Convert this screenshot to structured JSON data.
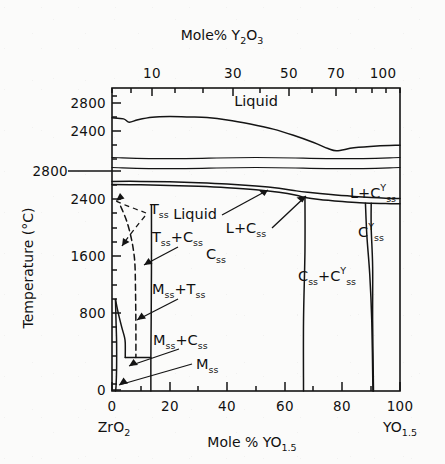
{
  "figure": {
    "kind": "phase-diagram",
    "top_axis_title": "Mole% Y2O3",
    "top_axis_title_parts": {
      "prefix": "Mole% Y",
      "sub1": "2",
      "mid": "O",
      "sub2": "3"
    },
    "bottom_axis_title_parts": {
      "prefix": "Mole % YO",
      "sub": "1.5"
    },
    "y_axis_title": "Temperature (°C)",
    "left_endmember": {
      "prefix": "ZrO",
      "sub": "2"
    },
    "right_endmember": {
      "prefix": "YO",
      "sub": "1.5"
    },
    "line_color": "#141414"
  },
  "axes": {
    "top_ticks_labeled": [
      "10",
      "30",
      "50",
      "70",
      "100"
    ],
    "top_ticks_labeled_x": [
      152,
      233,
      289,
      336,
      383
    ],
    "top_ticks_minor_x": [
      112,
      131,
      152,
      175,
      203,
      233,
      260,
      289,
      312,
      336,
      356,
      372,
      386,
      400
    ],
    "bottom_ticks_labeled": [
      "0",
      "20",
      "40",
      "60",
      "80",
      "100"
    ],
    "bottom_ticks_labeled_x": [
      112,
      170,
      227,
      285,
      342,
      400
    ],
    "bottom_ticks_minor_x": [
      112,
      141,
      170,
      198,
      227,
      256,
      285,
      313,
      342,
      371,
      400
    ],
    "left_ticks_labeled_upper": [
      "2800",
      "2400"
    ],
    "left_ticks_labeled_upper_y": [
      103,
      131
    ],
    "left_ticks_labeled_lower": [
      "2800",
      "2400",
      "1600",
      "800",
      "0"
    ],
    "left_ticks_labeled_lower_y": [
      171,
      199,
      256,
      313,
      390
    ],
    "left_ticks_minor_y": [
      96,
      103,
      117,
      131,
      145,
      159,
      171,
      185,
      199,
      213,
      228,
      242,
      256,
      270,
      285,
      299,
      313,
      327,
      342,
      356,
      370,
      384,
      390
    ],
    "break_marker_y": 171,
    "x_range": [
      0,
      100
    ],
    "plot_box": {
      "left": 112,
      "right": 400,
      "top": 88,
      "bottom": 391
    }
  },
  "labels": {
    "liquid_upper": "Liquid",
    "liquid_lower": "Liquid",
    "l_plus_css": {
      "prefix": "L+C",
      "sub": "ss"
    },
    "l_plus_css_y": {
      "prefix": "L+C",
      "sub": "ss",
      "sup": "Y"
    },
    "css_y": {
      "prefix": "C",
      "sub": "ss",
      "sup": "Y"
    },
    "css": {
      "prefix": "C",
      "sub": "ss"
    },
    "css_plus_css_y": {
      "prefix": "C",
      "sub": "ss",
      "plus": "+C",
      "sub2": "ss",
      "sup": "Y"
    },
    "tss": {
      "prefix": "T",
      "sub": "ss"
    },
    "tss_plus_css": {
      "prefix": "T",
      "sub": "ss",
      "plus": "+C",
      "sub2": "ss"
    },
    "mss_plus_tss": {
      "prefix": "M",
      "sub": "ss",
      "plus": "+T",
      "sub2": "ss"
    },
    "mss_plus_css": {
      "prefix": "M",
      "sub": "ss",
      "plus": "+C",
      "sub2": "ss"
    },
    "mss": {
      "prefix": "M",
      "sub": "ss"
    }
  },
  "chart_data": {
    "type": "line",
    "xlabel": "Mole % YO1.5",
    "ylabel": "Temperature (°C)",
    "xlim": [
      0,
      100
    ],
    "grid": false,
    "legend": "none",
    "top_panel_ylim": [
      2300,
      3000
    ],
    "bottom_panel_ylim": [
      0,
      2950
    ],
    "series": [
      {
        "name": "upper liquidus (top panel)",
        "points": [
          [
            0,
            2710
          ],
          [
            4,
            2700
          ],
          [
            6,
            2668
          ],
          [
            9,
            2692
          ],
          [
            14,
            2716
          ],
          [
            20,
            2722
          ],
          [
            27,
            2718
          ],
          [
            33,
            2712
          ],
          [
            40,
            2690
          ],
          [
            48,
            2650
          ],
          [
            56,
            2600
          ],
          [
            63,
            2540
          ],
          [
            70,
            2470
          ],
          [
            75,
            2412
          ],
          [
            78,
            2390
          ],
          [
            84,
            2418
          ],
          [
            92,
            2436
          ],
          [
            100,
            2444
          ]
        ]
      },
      {
        "name": "band-line-1 (panel break upper edge)",
        "points": [
          [
            0,
            2840
          ],
          [
            20,
            2845
          ],
          [
            50,
            2845
          ],
          [
            80,
            2842
          ],
          [
            100,
            2843
          ]
        ]
      },
      {
        "name": "band-line-2 (panel break lower edge)",
        "points": [
          [
            0,
            2812
          ],
          [
            20,
            2816
          ],
          [
            50,
            2816
          ],
          [
            80,
            2812
          ],
          [
            100,
            2814
          ]
        ]
      },
      {
        "name": "lower liquidus",
        "points": [
          [
            0,
            2700
          ],
          [
            10,
            2700
          ],
          [
            20,
            2694
          ],
          [
            30,
            2684
          ],
          [
            40,
            2668
          ],
          [
            50,
            2642
          ],
          [
            58,
            2612
          ],
          [
            64,
            2578
          ],
          [
            68,
            2560
          ],
          [
            76,
            2530
          ],
          [
            84,
            2506
          ],
          [
            90,
            2492
          ],
          [
            95,
            2484
          ],
          [
            100,
            2480
          ]
        ]
      },
      {
        "name": "lower solidus (Css boundary)",
        "points": [
          [
            0,
            2660
          ],
          [
            10,
            2656
          ],
          [
            20,
            2648
          ],
          [
            30,
            2636
          ],
          [
            40,
            2618
          ],
          [
            50,
            2592
          ],
          [
            58,
            2560
          ],
          [
            64,
            2522
          ],
          [
            67,
            2492
          ],
          [
            72,
            2466
          ],
          [
            80,
            2440
          ],
          [
            86,
            2424
          ],
          [
            90,
            2418
          ],
          [
            95,
            2414
          ],
          [
            100,
            2412
          ]
        ]
      },
      {
        "name": "Css / Css+CssY boundary (vertical at ~67%)",
        "points": [
          [
            67,
            2492
          ],
          [
            67,
            1800
          ],
          [
            66.5,
            900
          ],
          [
            66.5,
            0
          ]
        ]
      },
      {
        "name": "CssY left boundary",
        "points": [
          [
            90,
            2418
          ],
          [
            90,
            2100
          ],
          [
            90.5,
            1600
          ],
          [
            90.5,
            900
          ],
          [
            90.8,
            0
          ]
        ]
      },
      {
        "name": "CssY right / Css+CssY right boundary",
        "points": [
          [
            88,
            2420
          ],
          [
            88.5,
            2000
          ],
          [
            89.5,
            1500
          ],
          [
            90.2,
            900
          ],
          [
            90.6,
            0
          ]
        ]
      },
      {
        "name": "Tss solvus (solid, near 13-14%)",
        "points": [
          [
            13.7,
            2400
          ],
          [
            13.7,
            1600
          ],
          [
            13.6,
            900
          ],
          [
            13.5,
            430
          ],
          [
            13.5,
            0
          ]
        ]
      },
      {
        "name": "Tss/Css dashed metastable",
        "points": [
          [
            3,
            2380
          ],
          [
            5,
            2200
          ],
          [
            6.5,
            2000
          ],
          [
            7.5,
            1800
          ],
          [
            8,
            1600
          ],
          [
            8.2,
            1200
          ],
          [
            8.3,
            800
          ],
          [
            8.3,
            430
          ]
        ],
        "style": "dashed"
      },
      {
        "name": "Mss+Tss boundary",
        "points": [
          [
            1.2,
            1180
          ],
          [
            2.2,
            1000
          ],
          [
            3.4,
            820
          ],
          [
            4.3,
            700
          ],
          [
            4.6,
            620
          ],
          [
            4.6,
            430
          ]
        ]
      },
      {
        "name": "Mss left boundary",
        "points": [
          [
            1.2,
            1180
          ],
          [
            1.4,
            900
          ],
          [
            1.6,
            620
          ],
          [
            1.6,
            300
          ],
          [
            1.4,
            60
          ],
          [
            1.2,
            0
          ]
        ]
      },
      {
        "name": "Mss+Css eutectoid tie line",
        "points": [
          [
            4.6,
            430
          ],
          [
            13.5,
            430
          ]
        ]
      }
    ],
    "annotations": [
      {
        "text": "Liquid",
        "x": 40,
        "y": 2800,
        "panel": "top"
      },
      {
        "text": "Liquid",
        "x": 23,
        "y": 2540,
        "panel": "bottom"
      },
      {
        "text": "L+Css",
        "x": 45,
        "y": 2380,
        "panel": "bottom"
      },
      {
        "text": "L+CssY",
        "x": 82,
        "y": 2640,
        "panel": "bottom"
      },
      {
        "text": "CssY",
        "x": 89,
        "y": 2250,
        "panel": "bottom"
      },
      {
        "text": "Css",
        "x": 35,
        "y": 1680,
        "panel": "bottom"
      },
      {
        "text": "Css+CssY",
        "x": 78,
        "y": 1480,
        "panel": "bottom"
      },
      {
        "text": "Tss",
        "x": 9,
        "y": 2330,
        "panel": "bottom"
      },
      {
        "text": "Tss+Css",
        "x": 20,
        "y": 1950,
        "panel": "bottom"
      },
      {
        "text": "Mss+Tss",
        "x": 22,
        "y": 1100,
        "panel": "bottom"
      },
      {
        "text": "Mss+Css",
        "x": 22,
        "y": 560,
        "panel": "bottom"
      },
      {
        "text": "Mss",
        "x": 32,
        "y": 300,
        "panel": "bottom"
      }
    ]
  }
}
